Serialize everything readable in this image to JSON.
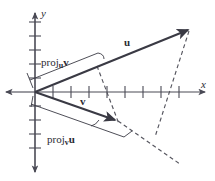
{
  "figure": {
    "background_color": "#ffffff",
    "line_color": "#3a3a44",
    "axis_color": "#4a4a55"
  },
  "axes": {
    "x_label": "x",
    "y_label": "y",
    "origin": {
      "x": 35,
      "y": 92
    },
    "x_tick_count_positive": 9,
    "x_tick_spacing": 18,
    "y_tick_spacing": 14,
    "y_tick_count_up": 5,
    "y_tick_count_down": 4
  },
  "vectors": [
    {
      "name": "u",
      "label": "u",
      "bold": true,
      "from": {
        "x": 35,
        "y": 92
      },
      "to": {
        "x": 190,
        "y": 29
      },
      "style": "solid-arrow"
    },
    {
      "name": "v",
      "label": "v",
      "bold": true,
      "from": {
        "x": 35,
        "y": 92
      },
      "to": {
        "x": 118,
        "y": 121
      },
      "style": "solid-arrow"
    }
  ],
  "projections": [
    {
      "name": "proj-u-v",
      "label_prefix": "proj",
      "label_subscript": "u",
      "label_operand": "v",
      "bracket_from": {
        "x": 35,
        "y": 85
      },
      "bracket_to": {
        "x": 100,
        "y": 58
      }
    },
    {
      "name": "proj-v-u",
      "label_prefix": "proj",
      "label_subscript": "v",
      "label_operand": "u",
      "bracket_from": {
        "x": 34,
        "y": 100
      },
      "bracket_to": {
        "x": 124,
        "y": 131
      }
    }
  ],
  "dashed_lines": [
    {
      "name": "perpendicular-from-u-to-v",
      "from": {
        "x": 97,
        "y": 66
      },
      "to": {
        "x": 119,
        "y": 124
      }
    },
    {
      "name": "perpendicular-from-v-to-u",
      "from": {
        "x": 190,
        "y": 29
      },
      "to": {
        "x": 155,
        "y": 137
      }
    },
    {
      "name": "v-extension",
      "from": {
        "x": 118,
        "y": 121
      },
      "to": {
        "x": 178,
        "y": 163
      }
    }
  ]
}
